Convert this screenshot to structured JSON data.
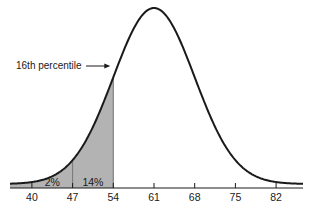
{
  "chart_data": {
    "type": "area",
    "title": "",
    "xlabel": "",
    "ylabel": "",
    "distribution": "normal",
    "mean": 61,
    "sd": 7,
    "x_ticks": [
      40,
      47,
      54,
      61,
      68,
      75,
      82
    ],
    "shaded_region": {
      "from": 33,
      "to": 54,
      "color": "#b3b3b3"
    },
    "region_labels": [
      {
        "text": "2%",
        "x_center": 43.5
      },
      {
        "text": "14%",
        "x_center": 50.5
      }
    ],
    "divider_lines": [
      47
    ],
    "annotation": {
      "text": "16th percentile",
      "points_to_x": 54
    },
    "grid": false,
    "legend": null
  },
  "colors": {
    "curve": "#1a1a1a",
    "shade": "#b3b3b3",
    "axis": "#1a1a1a"
  }
}
